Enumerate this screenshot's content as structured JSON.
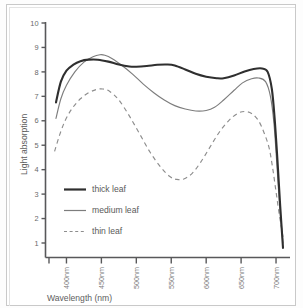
{
  "figure": {
    "background_color": "#ffffff",
    "frame_color": "#c9c9c9"
  },
  "chart_data": {
    "type": "line",
    "title": "",
    "subtitle": "",
    "xlabel": "Wavelength (nm)",
    "ylabel": "Light absorption",
    "xlim": [
      370,
      720
    ],
    "ylim": [
      0.4,
      10
    ],
    "grid": false,
    "legend_position": "inside-lower-left",
    "x_tick_labels": [
      "400nm",
      "450nm",
      "500nm",
      "550nm",
      "600nm",
      "650nm",
      "700nm"
    ],
    "x_tick_values": [
      400,
      450,
      500,
      550,
      600,
      650,
      700
    ],
    "y_tick_labels": [
      "1",
      "2",
      "3",
      "4",
      "5",
      "6",
      "7",
      "8",
      "9",
      "10"
    ],
    "y_tick_values": [
      1,
      2,
      3,
      4,
      5,
      6,
      7,
      8,
      9,
      10
    ],
    "series": [
      {
        "name": "thick leaf",
        "style": "solid-thick",
        "color": "#2f2f2f",
        "x": [
          385,
          392,
          400,
          410,
          420,
          432,
          445,
          460,
          475,
          490,
          500,
          515,
          530,
          545,
          555,
          570,
          585,
          600,
          615,
          625,
          640,
          655,
          668,
          680,
          688,
          694,
          698,
          702,
          706,
          710
        ],
        "y": [
          6.75,
          7.6,
          8.05,
          8.3,
          8.44,
          8.5,
          8.5,
          8.42,
          8.3,
          8.22,
          8.21,
          8.24,
          8.29,
          8.3,
          8.26,
          8.1,
          7.92,
          7.8,
          7.74,
          7.74,
          7.85,
          8.02,
          8.12,
          8.14,
          8.0,
          7.3,
          6.1,
          4.4,
          2.5,
          0.8
        ]
      },
      {
        "name": "medium leaf",
        "style": "solid-thin",
        "color": "#7d7d7d",
        "x": [
          385,
          392,
          400,
          412,
          425,
          438,
          448,
          455,
          465,
          480,
          495,
          510,
          525,
          540,
          555,
          570,
          585,
          600,
          612,
          625,
          640,
          652,
          665,
          675,
          685,
          692,
          697,
          701,
          705,
          710
        ],
        "y": [
          6.1,
          6.9,
          7.45,
          8.0,
          8.4,
          8.62,
          8.7,
          8.68,
          8.55,
          8.25,
          7.9,
          7.5,
          7.15,
          6.85,
          6.62,
          6.48,
          6.4,
          6.42,
          6.55,
          6.85,
          7.25,
          7.55,
          7.72,
          7.75,
          7.6,
          7.0,
          5.9,
          4.3,
          2.6,
          1.0
        ]
      },
      {
        "name": "thin leaf",
        "style": "dashed",
        "color": "#8d8d8d",
        "x": [
          383,
          390,
          398,
          408,
          420,
          432,
          443,
          452,
          462,
          475,
          490,
          505,
          520,
          535,
          548,
          558,
          568,
          580,
          592,
          605,
          618,
          632,
          645,
          655,
          665,
          675,
          683,
          690,
          695,
          700,
          705,
          710
        ],
        "y": [
          4.75,
          5.4,
          6.0,
          6.5,
          6.9,
          7.15,
          7.28,
          7.3,
          7.2,
          6.85,
          6.2,
          5.45,
          4.7,
          4.1,
          3.72,
          3.6,
          3.62,
          3.85,
          4.3,
          4.9,
          5.5,
          6.0,
          6.3,
          6.38,
          6.3,
          6.0,
          5.5,
          4.9,
          4.1,
          3.1,
          2.1,
          1.25
        ]
      }
    ],
    "legend_entries": [
      {
        "label": "thick leaf",
        "style": "solid-thick"
      },
      {
        "label": "medium leaf",
        "style": "solid-thin"
      },
      {
        "label": "thin leaf",
        "style": "dashed"
      }
    ]
  }
}
